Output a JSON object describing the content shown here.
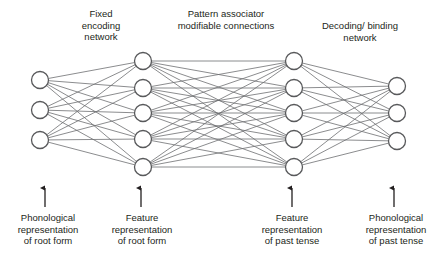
{
  "figure": {
    "kind": "neural-network-architecture-diagram",
    "background_color": "#ffffff",
    "ink_color": "#231f20",
    "node_stroke_color": "#58595b",
    "edge_color": "#6d6e71",
    "node_fill_color": "#ffffff"
  },
  "titles": {
    "encoding": "Fixed\nencoding\nnetwork",
    "associator": "Pattern associator\nmodifiable connections",
    "decoding": "Decoding/ binding\nnetwork"
  },
  "io_labels": {
    "phonological_root": "Phonological\nrepresentation\nof root form",
    "feature_root": "Feature\nrepresentation\nof root form",
    "feature_past": "Feature\nrepresentation\nof past tense",
    "phonological_past": "Phonological\nrepresentation\nof past tense"
  },
  "chart_data": {
    "type": "diagram",
    "layers": [
      {
        "name": "phonological-input-layer",
        "label": "Phonological representation of root form",
        "x": 40,
        "node_count": 3,
        "node_y": [
          80,
          110,
          140
        ]
      },
      {
        "name": "feature-root-layer",
        "label": "Feature representation of root form",
        "x": 143,
        "node_count": 5,
        "node_y": [
          61,
          88,
          113,
          139,
          167
        ]
      },
      {
        "name": "feature-past-layer",
        "label": "Feature representation of past tense",
        "x": 294,
        "node_count": 5,
        "node_y": [
          61,
          88,
          113,
          139,
          167
        ]
      },
      {
        "name": "phonological-output-layer",
        "label": "Phonological representation of past tense",
        "x": 397,
        "node_count": 3,
        "node_y": [
          86,
          113,
          141
        ]
      }
    ],
    "connections": [
      {
        "from": "phonological-input-layer",
        "to": "feature-root-layer",
        "pattern": "fully-connected",
        "group": "Fixed encoding network"
      },
      {
        "from": "feature-root-layer",
        "to": "feature-past-layer",
        "pattern": "fully-connected",
        "group": "Pattern associator modifiable connections"
      },
      {
        "from": "feature-past-layer",
        "to": "phonological-output-layer",
        "pattern": "fully-connected",
        "group": "Decoding/ binding network"
      }
    ],
    "arrows": [
      {
        "name": "arrow-phonological-root",
        "x": 45,
        "y_from": 207,
        "y_to": 188,
        "direction": "up"
      },
      {
        "name": "arrow-feature-root",
        "x": 141,
        "y_from": 207,
        "y_to": 188,
        "direction": "up"
      },
      {
        "name": "arrow-feature-past",
        "x": 292,
        "y_from": 207,
        "y_to": 188,
        "direction": "up"
      },
      {
        "name": "arrow-phonological-past",
        "x": 394,
        "y_from": 207,
        "y_to": 188,
        "direction": "up"
      }
    ],
    "node_radius": 8.5
  }
}
